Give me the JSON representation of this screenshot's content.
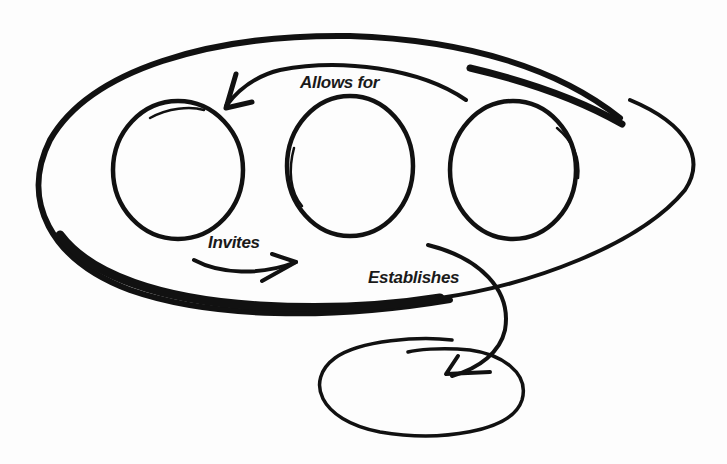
{
  "diagram": {
    "type": "hand-drawn sketch",
    "background": "#fdfdfd",
    "stroke_color": "#111111",
    "container": {
      "shape": "large oval",
      "contains": [
        "circle-1",
        "circle-2",
        "circle-3"
      ]
    },
    "nodes": [
      {
        "id": "circle-1",
        "shape": "circle",
        "label": ""
      },
      {
        "id": "circle-2",
        "shape": "circle",
        "label": ""
      },
      {
        "id": "circle-3",
        "shape": "circle",
        "label": ""
      },
      {
        "id": "outer-oval",
        "shape": "small oval",
        "label": ""
      }
    ],
    "edges": [
      {
        "from": "circle-3",
        "to": "circle-1",
        "label": "Allows for"
      },
      {
        "from": "circle-1",
        "to": "circle-2",
        "label": "Invites"
      },
      {
        "from": "large-oval",
        "to": "outer-oval",
        "label": "Establishes"
      }
    ]
  },
  "labels": {
    "allows_for": "Allows for",
    "invites": "Invites",
    "establishes": "Establishes"
  }
}
